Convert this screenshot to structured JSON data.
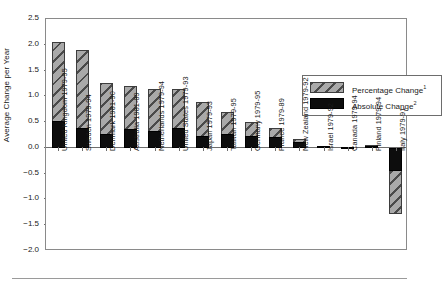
{
  "chart_data": {
    "type": "bar",
    "title": "",
    "subtitle": "",
    "xlabel": "",
    "ylabel": "Average Change per Year",
    "ylim": [
      -2.0,
      2.5
    ],
    "ytick_labels": [
      "2.5",
      "2.0",
      "1.5",
      "1.0",
      "0.5",
      "0.0",
      "−0.5",
      "−1.0",
      "−1.5",
      "−2.0"
    ],
    "ytick_values": [
      2.5,
      2.0,
      1.5,
      1.0,
      0.5,
      0.0,
      -0.5,
      -1.0,
      -1.5,
      -2.0
    ],
    "grid": false,
    "legend_position": "upper-right",
    "categories": [
      "United Kingdom 1979-95",
      "Sweden 1979-94",
      "Denmark 1981-90",
      "Australia 1981-89",
      "Netherlands 1979-94",
      "United States 1979-93",
      "Japan 1979-93",
      "Taiwan 1979-95",
      "Germany 1979-95",
      "France 1979-89",
      "New Zealand 1979-92",
      "Israel 1979-92",
      "Canada 1979-94",
      "Finland 1979-94",
      "Italy 1979-91"
    ],
    "series": [
      {
        "name": "Percentage Change",
        "footnote": "1",
        "color": "#a9a9a9",
        "pattern": "diagonal-hatch",
        "values": [
          2.05,
          1.89,
          1.26,
          1.2,
          1.15,
          1.14,
          0.89,
          0.69,
          0.51,
          0.38,
          0.18,
          0.04,
          0.02,
          0.05,
          -1.28
        ]
      },
      {
        "name": "Absolute Change",
        "footnote": "2",
        "color": "#0d0d0d",
        "pattern": "solid",
        "values": [
          0.52,
          0.39,
          0.26,
          0.37,
          0.32,
          0.39,
          0.23,
          0.27,
          0.24,
          0.22,
          0.12,
          0.03,
          0.01,
          0.03,
          -0.45
        ]
      }
    ]
  },
  "legend": {
    "items": [
      {
        "label": "Percentage Change",
        "footnote": "1"
      },
      {
        "label": "Absolute Change",
        "footnote": "2"
      }
    ]
  }
}
